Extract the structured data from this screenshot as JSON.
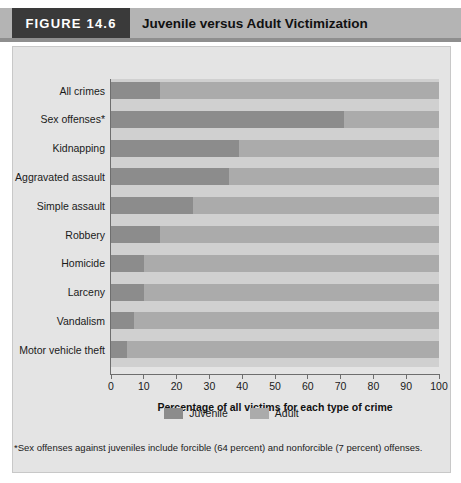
{
  "header": {
    "figure_tag": "FIGURE 14.6",
    "title": "Juvenile versus Adult Victimization"
  },
  "footnote": "*Sex offenses against juveniles include forcible (64 percent) and nonforcible (7 percent) offenses.",
  "legend": {
    "position": "bottom-center",
    "items": [
      {
        "label": "Juvenile",
        "color": "#8c8c8c"
      },
      {
        "label": "Adult",
        "color": "#ababab"
      }
    ]
  },
  "colors": {
    "juvenile": "#8c8c8c",
    "adult": "#ababab",
    "panel_background": "#e4e4e4",
    "plot_background": "#d0d0d0",
    "header_band": "#b4b4b4",
    "figure_tag_background": "#3a3a3a"
  },
  "chart_data": {
    "type": "bar",
    "orientation": "horizontal",
    "stacked": true,
    "stack_total": 100,
    "title": "Juvenile versus Adult Victimization",
    "xlabel": "Percentage of all victims for each type of crime",
    "ylabel": "",
    "xlim": [
      0,
      100
    ],
    "xticks": [
      0,
      10,
      20,
      30,
      40,
      50,
      60,
      70,
      80,
      90,
      100
    ],
    "grid": false,
    "legend_position": "bottom-center",
    "categories": [
      "All crimes",
      "Sex offenses*",
      "Kidnapping",
      "Aggravated assault",
      "Simple assault",
      "Robbery",
      "Homicide",
      "Larceny",
      "Vandalism",
      "Motor vehicle theft"
    ],
    "series": [
      {
        "name": "Juvenile",
        "color": "#8c8c8c",
        "values": [
          15,
          71,
          39,
          36,
          25,
          15,
          10,
          10,
          7,
          5
        ]
      },
      {
        "name": "Adult",
        "color": "#ababab",
        "values": [
          85,
          29,
          61,
          64,
          75,
          85,
          90,
          90,
          93,
          95
        ]
      }
    ]
  }
}
